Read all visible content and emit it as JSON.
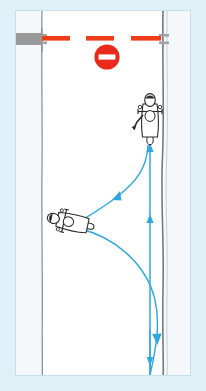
{
  "figure": {
    "canvas": {
      "width": 206,
      "height": 391
    },
    "colors": {
      "outer_background": "#dff0f7",
      "panel_background": "#ffffff",
      "panel_border": "#b9d9e8",
      "road_surface": "#ffffff",
      "verge_fill": "#f3f7f9",
      "road_edge_line": "#8a8f93",
      "barrier_red": "#ee3d18",
      "sign_red": "#e8291c",
      "sign_white": "#ffffff",
      "board_gray": "#9a9a9a",
      "post_gray": "#9b9b9b",
      "path_blue": "#2ea9e0",
      "rider_outline": "#2b2b2b",
      "rider_fill": "#ffffff"
    }
  },
  "scene": {
    "road": {
      "name": "road",
      "left_edge_x": 42,
      "right_edge_x": 163,
      "surface_label": "carriageway"
    },
    "barrier": {
      "name": "road-closed-barrier",
      "y": 38,
      "segments": 3,
      "segment_color": "#ee3d18",
      "posts": 2
    },
    "no_entry_sign": {
      "name": "no-entry-sign",
      "label": "No entry",
      "cx": 107,
      "cy": 57,
      "r": 13,
      "ring_color": "#e8291c",
      "bar_color": "#ffffff"
    },
    "notice_board": {
      "name": "notice-board",
      "x": 15,
      "y": 33,
      "width": 27,
      "height": 12,
      "color": "#9a9a9a"
    },
    "riders": [
      {
        "name": "rider-upper",
        "label": "Motorcyclist stopped at barrier, signalling",
        "x": 150,
        "y": 118,
        "heading_deg": 0,
        "signalling": true
      },
      {
        "name": "rider-lower",
        "label": "Motorcyclist approaching, turned left",
        "x": 70,
        "y": 222,
        "heading_deg": -78,
        "signalling": false
      }
    ],
    "paths": [
      {
        "name": "path-straight-approach",
        "style": "solid",
        "color": "#2ea9e0",
        "description": "Straight lane line running up the right side of the carriageway with forward arrows",
        "arrows": [
          {
            "at_y": 222,
            "direction": "up"
          },
          {
            "at_y": 150,
            "direction": "up"
          }
        ]
      },
      {
        "name": "path-turn-back",
        "style": "curve",
        "color": "#2ea9e0",
        "description": "Curved path from the barrier back down-left to the waiting rider",
        "arrows": [
          {
            "at_x": 110,
            "at_y": 190,
            "direction": "down-left"
          }
        ]
      },
      {
        "name": "path-u-turn-exit",
        "style": "curve",
        "color": "#2ea9e0",
        "description": "Curved path sweeping from the rider out to the right and back down the carriageway",
        "arrows": [
          {
            "at_x": 157,
            "at_y": 337,
            "direction": "down"
          },
          {
            "at_x": 152,
            "at_y": 369,
            "direction": "down"
          }
        ]
      }
    ]
  }
}
